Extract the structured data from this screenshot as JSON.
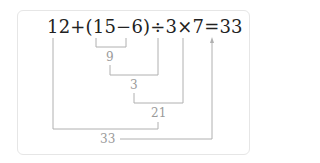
{
  "expression": "12+(15−6)÷3×7=33",
  "steps": [
    {
      "label": "9",
      "operation": "15−6"
    },
    {
      "label": "3",
      "operation": "9÷3"
    },
    {
      "label": "21",
      "operation": "3×7"
    },
    {
      "label": "33",
      "operation": "12+21"
    }
  ],
  "colors": {
    "text": "#222222",
    "lines": "#b0b0b0",
    "step_text": "#9a9a9a",
    "card_border": "#e6e6e6"
  }
}
